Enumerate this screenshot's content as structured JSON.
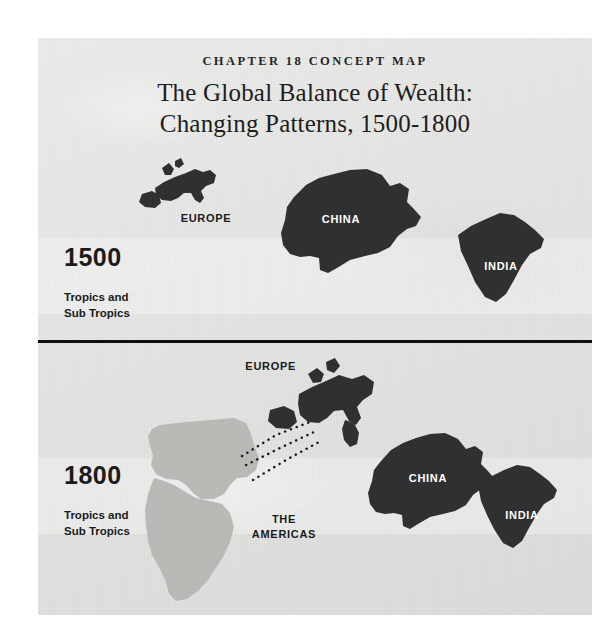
{
  "page": {
    "background_color": "#ffffff",
    "card_color": "#e3e3e1"
  },
  "header": {
    "eyebrow": "CHAPTER 18 CONCEPT MAP",
    "title_line1": "The Global Balance of Wealth:",
    "title_line2": "Changing Patterns, 1500-1800"
  },
  "colors": {
    "landmass_dark": "#2f3032",
    "landmass_light": "#b9bab6",
    "label_on_dark": "#ffffff",
    "text_dark": "#1b1b1b",
    "divider": "#101010"
  },
  "eras": [
    {
      "id": "era-1500",
      "year": "1500",
      "subtitle": "Tropics and\nSub Tropics",
      "regions": [
        {
          "name": "EUROPE",
          "style": "dark",
          "label_position": "below"
        },
        {
          "name": "CHINA",
          "style": "dark",
          "label_position": "inside"
        },
        {
          "name": "INDIA",
          "style": "dark",
          "label_position": "inside"
        }
      ]
    },
    {
      "id": "era-1800",
      "year": "1800",
      "subtitle": "Tropics and\nSub Tropics",
      "regions": [
        {
          "name": "EUROPE",
          "style": "dark",
          "label_position": "left"
        },
        {
          "name": "THE\nAMERICAS",
          "style": "light",
          "label_position": "right"
        },
        {
          "name": "CHINA",
          "style": "dark",
          "label_position": "inside"
        },
        {
          "name": "INDIA",
          "style": "dark",
          "label_position": "inside"
        }
      ],
      "flow_arrows": {
        "count": 3,
        "style": "dotted",
        "from": "THE AMERICAS",
        "to": "EUROPE"
      }
    }
  ]
}
